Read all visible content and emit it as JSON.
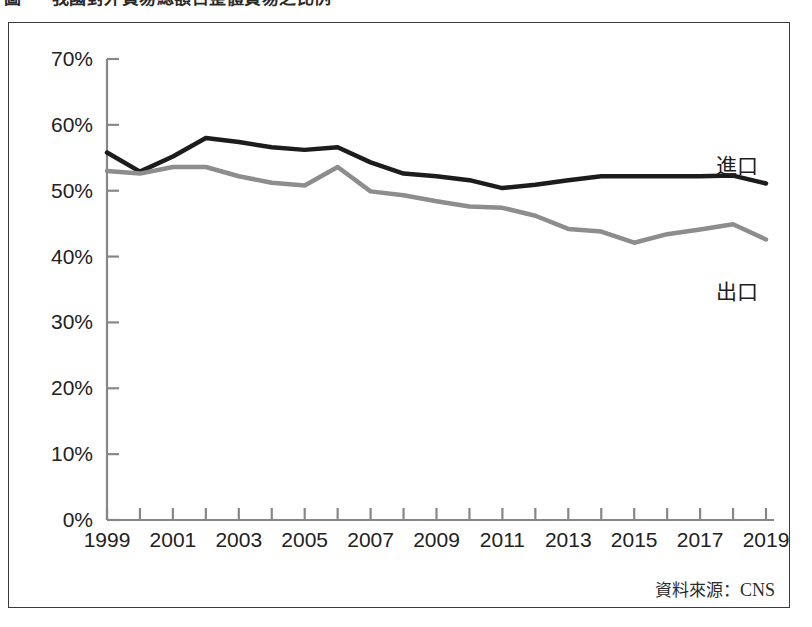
{
  "figure": {
    "title": "圖 　 我國對外貿易總額占整體貿易之比例",
    "title_visible_note": "clipped at top edge"
  },
  "source": {
    "label": "資料來源：",
    "value": "CNS"
  },
  "chart_data": {
    "type": "line",
    "title": "圖 　 我國對外貿易總額占整體貿易之比例",
    "xlabel": "",
    "ylabel": "",
    "xlim": [
      1999,
      2019
    ],
    "ylim": [
      0,
      70
    ],
    "grid": false,
    "legend_position": "right-inline",
    "y_ticks": [
      0,
      10,
      20,
      30,
      40,
      50,
      60,
      70
    ],
    "y_tick_labels": [
      "0%",
      "10%",
      "20%",
      "30%",
      "40%",
      "50%",
      "60%",
      "70%"
    ],
    "x_ticks": [
      1999,
      2000,
      2001,
      2002,
      2003,
      2004,
      2005,
      2006,
      2007,
      2008,
      2009,
      2010,
      2011,
      2012,
      2013,
      2014,
      2015,
      2016,
      2017,
      2018,
      2019
    ],
    "x_tick_labels": [
      "1999",
      "",
      "2001",
      "",
      "2003",
      "",
      "2005",
      "",
      "2007",
      "",
      "2009",
      "",
      "2011",
      "",
      "2013",
      "",
      "2015",
      "",
      "2017",
      "",
      "2019"
    ],
    "x": [
      1999,
      2000,
      2001,
      2002,
      2003,
      2004,
      2005,
      2006,
      2007,
      2008,
      2009,
      2010,
      2011,
      2012,
      2013,
      2014,
      2015,
      2016,
      2017,
      2018,
      2019
    ],
    "series": [
      {
        "name": "進口",
        "color": "#1c1c1c",
        "width": 4.5,
        "values": [
          55.8,
          52.9,
          55.2,
          58.0,
          57.4,
          56.6,
          56.2,
          56.6,
          54.3,
          52.6,
          52.2,
          51.6,
          50.4,
          50.9,
          51.6,
          52.2,
          52.2,
          52.2,
          52.2,
          52.3,
          51.1
        ]
      },
      {
        "name": "出口",
        "color": "#8d8d8d",
        "width": 4.5,
        "values": [
          53.0,
          52.6,
          53.6,
          53.6,
          52.2,
          51.2,
          50.8,
          53.6,
          49.9,
          49.3,
          48.4,
          47.6,
          47.4,
          46.2,
          44.2,
          43.8,
          42.1,
          43.4,
          44.1,
          44.9,
          42.6
        ]
      }
    ]
  },
  "y_axis": {
    "labels": [
      "70%",
      "60%",
      "50%",
      "40%",
      "30%",
      "20%",
      "10%",
      "0%"
    ]
  },
  "x_axis": {
    "labels": [
      "1999",
      "2001",
      "2003",
      "2005",
      "2007",
      "2009",
      "2011",
      "2013",
      "2015",
      "2017",
      "2019"
    ]
  },
  "series_labels": {
    "import": "進口",
    "export": "出口"
  },
  "colors": {
    "import_line": "#1c1c1c",
    "export_line": "#8d8d8d",
    "axis": "#878787",
    "frame": "#3b3b3b",
    "text": "#222222",
    "background": "#ffffff"
  }
}
